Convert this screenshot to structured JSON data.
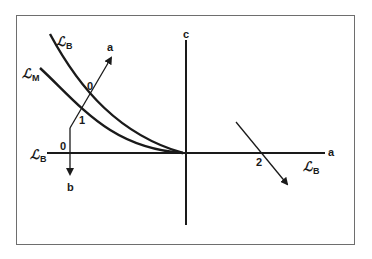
{
  "diagram": {
    "type": "phase/indifference-curve diagram",
    "frame": {
      "border_color": "#6e6e6e"
    },
    "axes": {
      "horizontal": {
        "label": "a",
        "from": [
          47,
          153
        ],
        "to": [
          325,
          153
        ]
      },
      "vertical": {
        "label": "c",
        "from": [
          186,
          40
        ],
        "to": [
          186,
          225
        ]
      }
    },
    "curves": [
      {
        "name": "curve-B",
        "symbol": "ℬ",
        "script_letter": "ℒ",
        "subscript": "B",
        "start": [
          50,
          34
        ],
        "end": [
          180,
          153
        ]
      },
      {
        "name": "curve-M",
        "symbol": "ℒ",
        "script_letter": "ℒ",
        "subscript": "M",
        "start": [
          40,
          68
        ],
        "end": [
          180,
          153
        ]
      }
    ],
    "arrows": [
      {
        "name": "arrow-a",
        "label": "a",
        "path": [
          [
            70,
            128
          ],
          [
            112,
            56
          ]
        ]
      },
      {
        "name": "arrow-b",
        "label": "b",
        "path": [
          [
            70,
            128
          ],
          [
            70,
            172
          ]
        ]
      },
      {
        "name": "arrow-2",
        "path": [
          [
            236,
            122
          ],
          [
            288,
            186
          ]
        ]
      }
    ],
    "labels": {
      "script_symbol": "ℒ",
      "curve_b_top": {
        "script": "ℒ",
        "sub": "B"
      },
      "curve_m": {
        "script": "ℒ",
        "sub": "M"
      },
      "axis_left": {
        "script": "ℒ",
        "sub": "B"
      },
      "axis_right": {
        "script": "ℒ",
        "sub": "B"
      },
      "point_0_upper": "0",
      "point_1": "1",
      "point_0_axis": "0",
      "point_2": "2",
      "arrow_a": "a",
      "arrow_b": "b",
      "axis_c": "c",
      "axis_a": "a"
    },
    "colors": {
      "ink": "#1a1a1a",
      "background": "#ffffff"
    }
  }
}
